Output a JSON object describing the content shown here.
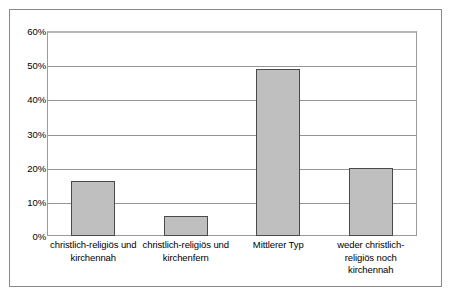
{
  "chart_data": {
    "type": "bar",
    "title": "",
    "subtitle": "",
    "xlabel": "",
    "ylabel": "",
    "categories": [
      "christlich-religiös und kirchennah",
      "christlich-religiös und kirchenfern",
      "Mittlerer Typ",
      "weder christlich-religiös noch kirchennah"
    ],
    "values": [
      16,
      6,
      49,
      20
    ],
    "value_labels": [
      "16%",
      "6%",
      "49%",
      "20%"
    ],
    "ylim": [
      0,
      60
    ],
    "ytick_values": [
      60,
      50,
      40,
      30,
      20,
      10,
      0
    ],
    "ytick_labels": [
      "60%",
      "50%",
      "40%",
      "30%",
      "20%",
      "10%",
      "0%"
    ],
    "grid": true,
    "grid_axis": "y",
    "legend": false,
    "legend_position": "none",
    "bar_color": "#bfbfbf",
    "bar_border_color": "#4a4a4a",
    "gridline_color": "#949494",
    "plot_border_color": "#9a9a9a",
    "frame_border_color": "#8a8a8a",
    "background_color": "#ffffff",
    "text_color": "#000000"
  }
}
